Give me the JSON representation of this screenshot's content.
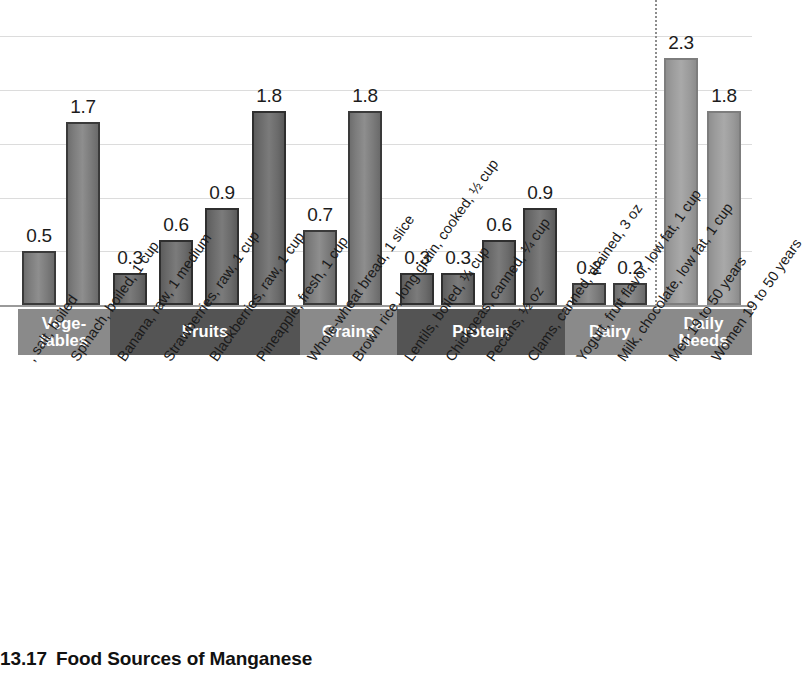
{
  "caption": {
    "figure_number": "13.17",
    "title": "Food Sources of Manganese"
  },
  "chart_data": {
    "type": "bar",
    "title": "Food Sources of Manganese",
    "xlabel": "",
    "ylabel": "",
    "ylim": [
      0,
      2.5
    ],
    "grid": true,
    "gridlines": [
      0.5,
      1.0,
      1.5,
      2.0,
      2.5
    ],
    "legend": "none",
    "units": "mg",
    "categories": [
      ", salt, boiled",
      "Spinach, boiled, 1 cup",
      "Banana, raw, 1 medium",
      "Strawberries, raw, 1 cup",
      "Blackberries, raw, 1 cup",
      "Pineapple, fresh, 1 cup",
      "Whole-wheat bread, 1 slice",
      "Brown rice, long grain, cooked, ½ cup",
      "Lentils, boiled, ¼ cup",
      "Chickpeas, canned, ¼ cup",
      "Pecans, ½ oz",
      "Clams, canned, drained, 3 oz",
      "Yogurt, fruit flavor, low fat, 1 cup",
      "Milk, chocolate, low fat, 1 cup",
      "Men 19 to 50 years",
      "Women 19 to 50 years"
    ],
    "values": [
      0.5,
      1.7,
      0.3,
      0.6,
      0.9,
      1.8,
      0.7,
      1.8,
      0.3,
      0.3,
      0.6,
      0.9,
      0.2,
      0.2,
      2.3,
      1.8
    ],
    "value_labels": [
      "0.5",
      "1.7",
      "0.3",
      "0.6",
      "0.9",
      "1.8",
      "0.7",
      "1.8",
      "0.3",
      "0.3",
      "0.6",
      "0.9",
      "0.2",
      "0.2",
      "2.3",
      "1.8"
    ],
    "groups": [
      {
        "label": "Vege-\ntables",
        "label_lines": [
          "Vege-",
          "tables"
        ],
        "tone": "tone-light",
        "bar_start": 0,
        "bar_end": 1
      },
      {
        "label": "Fruits",
        "label_lines": [
          "Fruits"
        ],
        "tone": "tone-dark",
        "bar_start": 2,
        "bar_end": 5
      },
      {
        "label": "Grains",
        "label_lines": [
          "Grains"
        ],
        "tone": "tone-light",
        "bar_start": 6,
        "bar_end": 7
      },
      {
        "label": "Protein",
        "label_lines": [
          "Protein"
        ],
        "tone": "tone-dark",
        "bar_start": 8,
        "bar_end": 11
      },
      {
        "label": "Dairy",
        "label_lines": [
          "Dairy"
        ],
        "tone": "tone-light",
        "bar_start": 12,
        "bar_end": 13
      },
      {
        "label": "Daily\nNeeds",
        "label_lines": [
          "Daily",
          "Needs"
        ],
        "tone": "tone-light",
        "bar_start": 14,
        "bar_end": 15
      }
    ],
    "divider_note": "dotted vertical line separating food sources from daily needs",
    "colors": {
      "bar_fill": "#8e8e8e",
      "bar_border": "#3a3a3a",
      "band_light": "#8a8a8a",
      "band_dark": "#545454",
      "gridline": "#dcdcdc",
      "text": "#1a1a1a"
    }
  }
}
